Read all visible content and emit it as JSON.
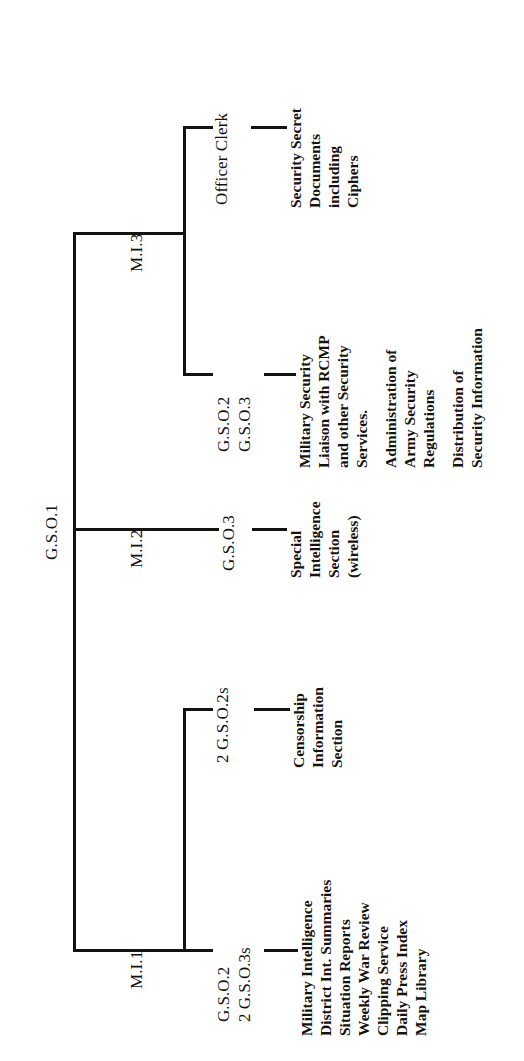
{
  "diagram": {
    "type": "organization-chart",
    "orientation": "rotated-90-counterclockwise",
    "root": {
      "code": "G.S.O.1"
    },
    "branches": [
      {
        "id": "mi1",
        "label": "M.I.1",
        "children": [
          {
            "id": "mi1-censorship",
            "code": "2 G.S.O.2s",
            "duties": [
              "Censorship",
              "Information",
              "Section"
            ]
          },
          {
            "id": "mi1-intelligence",
            "code_lines": [
              "G.S.O.2",
              "2 G.S.O.3s"
            ],
            "duties": [
              "Military Intelligence",
              "District Int. Summaries",
              "Situation Reports",
              "Weekly War Review",
              "Clipping Service",
              "Daily Press Index",
              "Map Library"
            ]
          }
        ]
      },
      {
        "id": "mi2",
        "label": "M.I.2",
        "children": [
          {
            "id": "mi2-special",
            "code": "G.S.O.3",
            "duties": [
              "Special",
              "Intelligence",
              "Section",
              "(wireless)"
            ]
          }
        ]
      },
      {
        "id": "mi3",
        "label": "M.I.3",
        "children": [
          {
            "id": "mi3-security",
            "code_lines": [
              "G.S.O.2",
              "G.S.O.3"
            ],
            "duty_groups": [
              [
                "Military Security",
                "Liaison with RCMP",
                "and other Security",
                "Services."
              ],
              [
                "Administration of",
                "Army Security",
                "Regulations"
              ],
              [
                "Distribution of",
                "Security Information"
              ]
            ]
          },
          {
            "id": "mi3-officer-clerk",
            "code": "Officer Clerk",
            "duties": [
              "Security Secret",
              "Documents",
              "including",
              "Ciphers"
            ]
          }
        ]
      }
    ],
    "colors": {
      "ink": "#15130f",
      "background": "#ffffff"
    }
  }
}
